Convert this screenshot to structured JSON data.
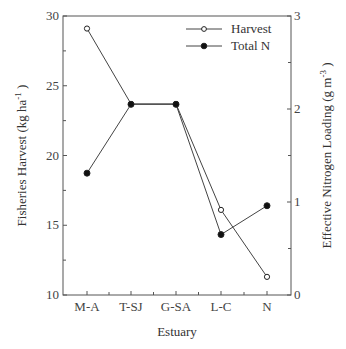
{
  "chart_data": {
    "type": "line",
    "title": "",
    "xlabel": "Estuary",
    "ylabel": "Fisheries Harvest (kg ha-1)",
    "ylabel_right": "Effective Nitrogen Loading (g m-3)",
    "categories": [
      "M-A",
      "T-SJ",
      "G-SA",
      "L-C",
      "N"
    ],
    "ylim": [
      10,
      30
    ],
    "ylim_right": [
      0,
      3
    ],
    "yticks": [
      10,
      15,
      20,
      25,
      30
    ],
    "yticks_right": [
      0,
      1,
      2,
      3
    ],
    "grid": false,
    "legend_position": "upper right",
    "series": [
      {
        "name": "Harvest",
        "axis": "left",
        "marker": "open-circle",
        "values": [
          29.1,
          23.7,
          23.7,
          16.1,
          11.3
        ]
      },
      {
        "name": "Total N",
        "axis": "right",
        "marker": "filled-circle",
        "values": [
          1.31,
          2.05,
          2.05,
          0.65,
          0.96
        ]
      }
    ]
  },
  "labels": {
    "xlabel": "Estuary",
    "ylabel_main": "Fisheries Harvest (kg ha",
    "ylabel_sup": "-1",
    "ylabel_end": " )",
    "ylabel_right_main": "Effective Nitrogen Loading (g m",
    "ylabel_right_sup": "-3",
    "ylabel_right_end": " )",
    "legend_harvest": "Harvest",
    "legend_totaln": "Total N"
  }
}
